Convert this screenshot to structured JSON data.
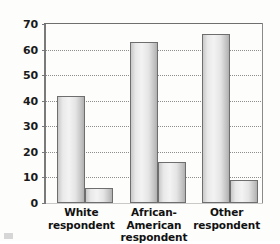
{
  "chart_data": {
    "type": "bar",
    "title": "",
    "subtitle": "",
    "xlabel": "",
    "ylabel": "",
    "ylim": [
      0,
      70
    ],
    "yticks": [
      0,
      10,
      20,
      30,
      40,
      50,
      60,
      70
    ],
    "ytick_labels": [
      "0",
      "10",
      "20",
      "30",
      "40",
      "50",
      "60",
      "70"
    ],
    "grid": true,
    "legend": "none",
    "categories": [
      "White respondent",
      "African-American respondent",
      "Other respondent"
    ],
    "category_lines": [
      {
        "line1": "White",
        "line2": "respondent"
      },
      {
        "line1": "African-American",
        "line2": "respondent"
      },
      {
        "line1": "Other",
        "line2": "respondent"
      }
    ],
    "series": [
      {
        "name": "series-1",
        "values": [
          42,
          63,
          66
        ]
      },
      {
        "name": "series-2",
        "values": [
          6,
          16,
          9
        ]
      }
    ],
    "bar_colors": {
      "fill_light": "#f3f3f3",
      "fill_mid": "#d8d8d8",
      "fill_dark": "#b0b0b0",
      "border": "#6e6e6e"
    },
    "axis_color": "#7a7a7a",
    "grid_color": "#8d8d8d",
    "background": "#fdfdfc",
    "text_color": "#111111"
  }
}
